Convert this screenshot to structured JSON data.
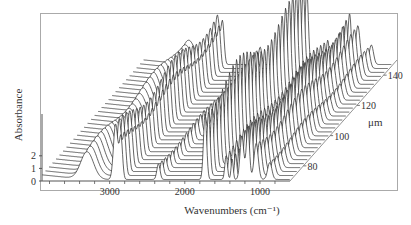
{
  "chart_data": {
    "type": "line",
    "subtype": "3d-waterfall",
    "title": "",
    "xlabel": "Wavenumbers (cm⁻¹)",
    "ylabel": "Absorbance",
    "zlabel": "μm",
    "x_ticks": [
      "3000",
      "2000",
      "1000"
    ],
    "x_tick_values": [
      3000,
      2000,
      1000
    ],
    "xlim": [
      3900,
      600
    ],
    "y_ticks": [
      "0",
      "1",
      "2"
    ],
    "y_tick_values": [
      0,
      1,
      2
    ],
    "ylim": [
      0,
      2.5
    ],
    "z_ticks": [
      "80",
      "100",
      "120",
      "140"
    ],
    "z_tick_values": [
      80,
      100,
      120,
      140
    ],
    "zlim": [
      70,
      150
    ],
    "series_count": 30,
    "peaks": [
      {
        "wavenumber": 3300,
        "height": 0.9,
        "width": 120
      },
      {
        "wavenumber": 2920,
        "height": 1.6,
        "width": 40
      },
      {
        "wavenumber": 2850,
        "height": 1.2,
        "width": 30
      },
      {
        "wavenumber": 2350,
        "height": 0.5,
        "width": 30
      },
      {
        "wavenumber": 1730,
        "height": 2.4,
        "width": 30
      },
      {
        "wavenumber": 1450,
        "height": 0.9,
        "width": 25
      },
      {
        "wavenumber": 1370,
        "height": 0.7,
        "width": 20
      },
      {
        "wavenumber": 1240,
        "height": 1.3,
        "width": 35
      },
      {
        "wavenumber": 1160,
        "height": 1.5,
        "width": 30
      },
      {
        "wavenumber": 1050,
        "height": 1.1,
        "width": 40
      },
      {
        "wavenumber": 870,
        "height": 0.6,
        "width": 40
      }
    ],
    "grid": false,
    "legend": "none",
    "colors": {
      "line": "#222222",
      "axis": "#555555",
      "frame": "#999999"
    }
  }
}
